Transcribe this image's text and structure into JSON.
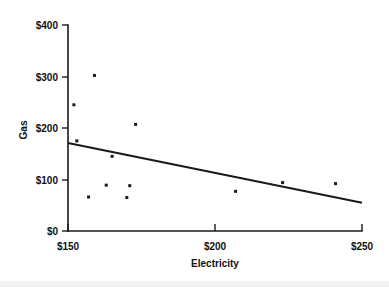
{
  "chart_data": {
    "type": "scatter",
    "title": "",
    "xlabel": "Electricity",
    "ylabel": "Gas",
    "xlim": [
      150,
      250
    ],
    "ylim": [
      0,
      400
    ],
    "grid": false,
    "legend": false,
    "x_tick_labels": [
      "$150",
      "$200",
      "$250"
    ],
    "x_ticks": [
      150,
      200,
      250
    ],
    "y_tick_labels": [
      "$0",
      "$100",
      "$200",
      "$300",
      "$400"
    ],
    "y_ticks": [
      0,
      100,
      200,
      300,
      400
    ],
    "points": [
      {
        "x": 152,
        "y": 245
      },
      {
        "x": 159,
        "y": 302
      },
      {
        "x": 153,
        "y": 175
      },
      {
        "x": 173,
        "y": 207
      },
      {
        "x": 165,
        "y": 145
      },
      {
        "x": 163,
        "y": 89
      },
      {
        "x": 171,
        "y": 88
      },
      {
        "x": 157,
        "y": 66
      },
      {
        "x": 170,
        "y": 65
      },
      {
        "x": 207,
        "y": 77
      },
      {
        "x": 223,
        "y": 94
      },
      {
        "x": 241,
        "y": 92
      }
    ],
    "series": [
      {
        "name": "Gas vs Electricity",
        "type": "scatter",
        "marker": "square",
        "color": "#1a1a1a"
      },
      {
        "name": "Trend line",
        "type": "line",
        "color": "#1a1a1a",
        "endpoints": [
          {
            "x": 150,
            "y": 171
          },
          {
            "x": 250,
            "y": 55
          }
        ]
      }
    ]
  },
  "axes": {
    "x_title": "Electricity",
    "y_title": "Gas",
    "x_tick_0": "$150",
    "x_tick_1": "$200",
    "x_tick_2": "$250",
    "y_tick_0": "$0",
    "y_tick_1": "$100",
    "y_tick_2": "$200",
    "y_tick_3": "$300",
    "y_tick_4": "$400"
  },
  "colors": {
    "ink": "#1a1a1a",
    "background": "#ffffff",
    "footer_band": "#f2f2f2"
  }
}
